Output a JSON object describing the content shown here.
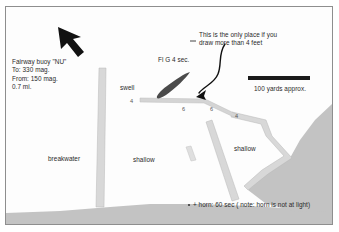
{
  "figure": {
    "kind": "harbor-approach-sketch",
    "width": 339,
    "height": 232,
    "background": "#ffffff",
    "border_color": "#8e8e8e",
    "water_color": "#fdfdfd",
    "land_color": "#c3c3c3",
    "jetty_color": "#d8d8d8",
    "marker_color": "#4b4b4b",
    "ink_color": "#2a2a2a"
  },
  "annotations": {
    "buoy_note": "Fairway buoy \"NU\"\nTo: 330 mag.\nFrom: 150 mag.\n0.7 mi.",
    "buoy_note_lines": [
      "Fairway buoy \"NU\"",
      "To: 330 mag.",
      "From: 150 mag.",
      "0.7 mi."
    ],
    "entrance_note": "This is the only place if you\ndraw more than 4 feet",
    "entrance_note_lines": [
      "This is the only place if you",
      "draw more than 4 feet"
    ],
    "light_label": "Fl G 4 sec.",
    "horn_note": "+ horn: 60 sec ( note: horn is not at light)",
    "scale_label": "100 yards approx."
  },
  "features": {
    "breakwater_label": "breakwater",
    "swell_label": "swell",
    "shallow_left_label": "shallow",
    "shallow_right_label": "shallow"
  },
  "soundings": [
    {
      "value": "4",
      "x": 130,
      "y": 97
    },
    {
      "value": "6",
      "x": 182,
      "y": 105
    },
    {
      "value": "6",
      "x": 210,
      "y": 105
    },
    {
      "value": "4",
      "x": 235,
      "y": 112
    }
  ],
  "scale_bar": {
    "x": 248,
    "y": 76,
    "length": 62,
    "thickness": 4
  },
  "north_arrow": {
    "bearing_note": "arrow points up-left toward fairway buoy"
  }
}
